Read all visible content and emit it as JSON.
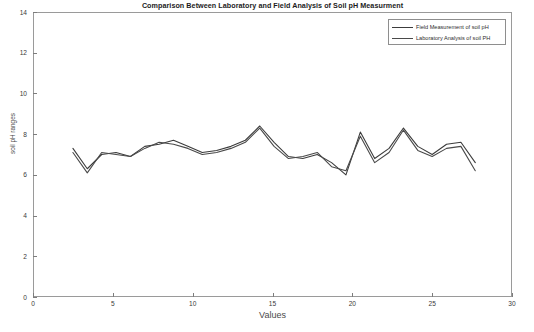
{
  "chart_data": {
    "type": "line",
    "title": "Comparison Between Laboratory and Field Analysis of Soil pH Measurment",
    "xlabel": "Values",
    "ylabel": "soil pH ranges",
    "xlim": [
      0,
      30
    ],
    "ylim": [
      0,
      14
    ],
    "xticks": [
      0,
      5,
      10,
      15,
      20,
      25,
      30
    ],
    "yticks": [
      0,
      2,
      4,
      6,
      8,
      10,
      12,
      14
    ],
    "grid": false,
    "legend_position": "top-right",
    "x": [
      2.5,
      3.4,
      4.3,
      5.2,
      6.1,
      7.0,
      7.9,
      8.8,
      9.7,
      10.6,
      11.5,
      12.4,
      13.3,
      14.2,
      15.1,
      16.0,
      16.9,
      17.8,
      18.7,
      19.6,
      20.5,
      21.4,
      22.3,
      23.2,
      24.1,
      25.0,
      25.9,
      26.8,
      27.7
    ],
    "series": [
      {
        "name": "Field Measurement of soil pH",
        "color": "#3c3c3c",
        "values": [
          7.3,
          6.3,
          7.0,
          7.1,
          6.9,
          7.4,
          7.5,
          7.7,
          7.4,
          7.1,
          7.2,
          7.4,
          7.7,
          8.4,
          7.6,
          6.9,
          6.8,
          7.0,
          6.6,
          6.0,
          8.1,
          6.8,
          7.3,
          8.3,
          7.4,
          7.0,
          7.5,
          7.6,
          6.6
        ]
      },
      {
        "name": "Laboratory Analysis of soil PH",
        "color": "#4a4a4a",
        "values": [
          7.1,
          6.1,
          7.1,
          7.0,
          6.9,
          7.3,
          7.6,
          7.5,
          7.3,
          7.0,
          7.1,
          7.3,
          7.6,
          8.3,
          7.4,
          6.8,
          6.9,
          7.1,
          6.4,
          6.2,
          7.9,
          6.6,
          7.1,
          8.2,
          7.2,
          6.9,
          7.3,
          7.4,
          6.2
        ]
      }
    ]
  },
  "axes": {
    "y_tick_labels": [
      "0",
      "2",
      "4",
      "6",
      "8",
      "10",
      "12",
      "14"
    ],
    "x_tick_labels": [
      "0",
      "5",
      "10",
      "15",
      "20",
      "25",
      "30"
    ]
  },
  "legend": {
    "items": [
      {
        "label": "Field Measurement of soil pH"
      },
      {
        "label": "Laboratory Analysis of soil PH"
      }
    ]
  }
}
